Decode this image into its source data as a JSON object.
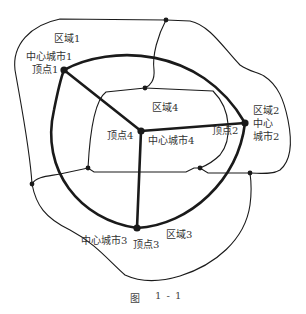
{
  "figure": {
    "caption_label": "图",
    "caption_number": "1 - 1"
  },
  "regions": [
    {
      "id": "region-1",
      "label": "区域1"
    },
    {
      "id": "region-2",
      "label": "区域2"
    },
    {
      "id": "region-3",
      "label": "区域3"
    },
    {
      "id": "region-4",
      "label": "区域4"
    }
  ],
  "cities": [
    {
      "id": "city-1",
      "label": "中心城市1"
    },
    {
      "id": "city-2-line1",
      "label": "中心"
    },
    {
      "id": "city-2-line2",
      "label": "城市2"
    },
    {
      "id": "city-3",
      "label": "中心城市3"
    },
    {
      "id": "city-4",
      "label": "中心城市4"
    }
  ],
  "vertices": [
    {
      "id": "vertex-1",
      "label": "顶点1"
    },
    {
      "id": "vertex-2",
      "label": "顶点2"
    },
    {
      "id": "vertex-3",
      "label": "顶点3"
    },
    {
      "id": "vertex-4",
      "label": "顶点4"
    }
  ],
  "colors": {
    "stroke": "#1a1a1a",
    "text": "#333333",
    "background": "#ffffff"
  }
}
